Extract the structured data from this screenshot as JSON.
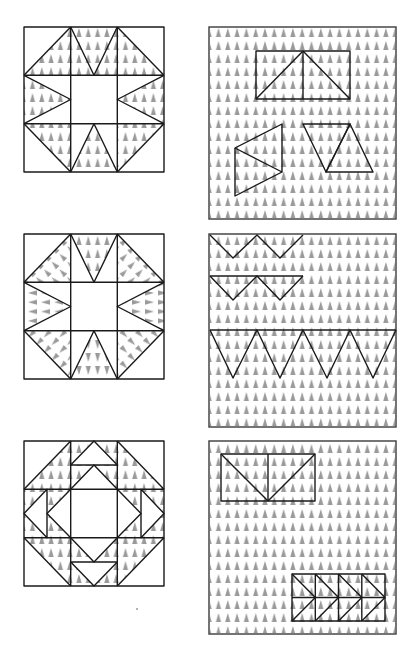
{
  "figure": {
    "colors": {
      "line": "#1a1a1a",
      "texture": "#9a9a9a",
      "background": "#ffffff"
    },
    "texture_icon": "cone-tick",
    "rows": [
      {
        "block": {
          "name": "sawtooth-star-block",
          "x": 24,
          "y": 27,
          "w": 140,
          "h": 145,
          "texture_direction": "up"
        },
        "cutting": {
          "name": "cutting-layout-1",
          "x": 209,
          "y": 27,
          "w": 187,
          "h": 192,
          "pieces": [
            "flying-geese-rectangle",
            "left-triangle-pair",
            "parallelogram-triangles"
          ]
        }
      },
      {
        "block": {
          "name": "radial-star-block",
          "x": 24,
          "y": 234,
          "w": 140,
          "h": 145,
          "texture_direction": "radial"
        },
        "cutting": {
          "name": "cutting-layout-2",
          "x": 209,
          "y": 234,
          "w": 187,
          "h": 193,
          "pieces": [
            "zigzag-row-1",
            "zigzag-row-2",
            "large-zigzag-row"
          ]
        }
      },
      {
        "block": {
          "name": "square-in-square-block",
          "x": 24,
          "y": 441,
          "w": 140,
          "h": 145,
          "texture_direction": "up"
        },
        "cutting": {
          "name": "cutting-layout-3",
          "x": 209,
          "y": 441,
          "w": 187,
          "h": 193,
          "pieces": [
            "flying-geese-rectangle",
            "arrow-triangle-strip"
          ]
        }
      }
    ]
  }
}
